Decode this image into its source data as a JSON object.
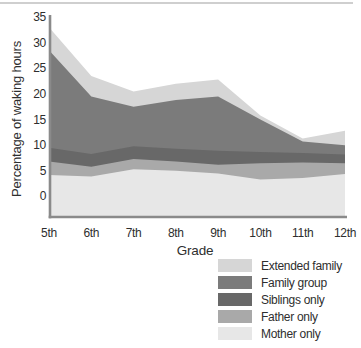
{
  "figure": {
    "y_axis_title": "Percentage of waking hours",
    "x_axis_title": "Grade"
  },
  "chart_data": {
    "type": "area",
    "stacked": true,
    "title": "",
    "xlabel": "Grade",
    "ylabel": "Percentage of waking hours",
    "categories": [
      "5th",
      "6th",
      "7th",
      "8th",
      "9th",
      "10th",
      "11th",
      "12th"
    ],
    "yticks": [
      0,
      5,
      10,
      15,
      20,
      25,
      30,
      35
    ],
    "ylim": [
      -4,
      35
    ],
    "grid": false,
    "baseline_note": "stacked areas are drawn down to the axis floor, slightly below the 0 tick",
    "series": [
      {
        "name": "Mother only",
        "color": "#e7e7e7",
        "values": [
          4.2,
          3.9,
          5.3,
          5.0,
          4.5,
          3.3,
          3.6,
          4.4
        ]
      },
      {
        "name": "Father only",
        "color": "#a9a9a9",
        "values": [
          2.6,
          1.9,
          2.0,
          1.8,
          1.7,
          3.2,
          3.0,
          2.1
        ]
      },
      {
        "name": "Siblings only",
        "color": "#686868",
        "values": [
          2.7,
          2.5,
          2.5,
          2.5,
          2.7,
          2.2,
          1.9,
          1.7
        ]
      },
      {
        "name": "Family group",
        "color": "#7b7b7b",
        "values": [
          19.0,
          11.2,
          7.7,
          9.5,
          10.6,
          6.3,
          2.2,
          1.8
        ]
      },
      {
        "name": "Extended family",
        "color": "#d6d6d6",
        "values": [
          4.5,
          4.0,
          3.0,
          3.2,
          3.3,
          0.8,
          0.6,
          2.8
        ]
      }
    ],
    "legend": {
      "position": "bottom-right",
      "entries_top_to_bottom": [
        {
          "label": "Extended family",
          "color": "#d6d6d6"
        },
        {
          "label": "Family group",
          "color": "#7b7b7b"
        },
        {
          "label": "Siblings only",
          "color": "#686868"
        },
        {
          "label": "Father only",
          "color": "#a9a9a9"
        },
        {
          "label": "Mother only",
          "color": "#e7e7e7"
        }
      ]
    }
  },
  "colors": {
    "axis_spine": "#8a8a8a",
    "text": "#2e2e2e",
    "top_rule": "#cfcfcf",
    "background": "#ffffff"
  }
}
